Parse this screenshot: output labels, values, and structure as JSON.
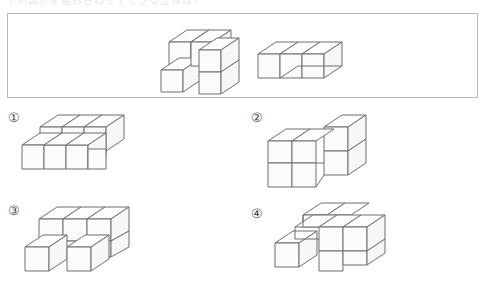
{
  "page": {
    "header_text_fragment": "下列図形を組み合わせてできる立体は？",
    "background_color": "#ffffff",
    "line_color": "#6f6f73",
    "box_border_color": "#b9b9bd"
  },
  "prompt": {
    "name": "prompt-box",
    "figures": [
      {
        "id": "prompt-figure-1",
        "description": "zig-zag cube assembly of 5 cubes",
        "cube_count": 5,
        "cubes": [
          {
            "x": 0,
            "y": 0,
            "z": 0
          },
          {
            "x": 1,
            "y": 0,
            "z": 0
          },
          {
            "x": 0,
            "y": 0,
            "z": 1
          },
          {
            "x": 1,
            "y": 1,
            "z": 0
          },
          {
            "x": 2,
            "y": 0,
            "z": 0
          }
        ]
      },
      {
        "id": "prompt-figure-2",
        "description": "row of 3 cubes with step",
        "cube_count": 3,
        "cubes": [
          {
            "x": 0,
            "y": 0,
            "z": 0
          },
          {
            "x": 1,
            "y": 0,
            "z": 0
          },
          {
            "x": 2,
            "y": 0,
            "z": 0
          }
        ]
      }
    ]
  },
  "options": [
    {
      "id": "option-1",
      "label": "①",
      "cube_count": 8,
      "description": "stepped block, two levels, upper-left row of three"
    },
    {
      "id": "option-2",
      "label": "②",
      "cube_count": 8,
      "description": "L-shaped two-level block with tall column at right"
    },
    {
      "id": "option-3",
      "label": "③",
      "cube_count": 9,
      "description": "three-wide upper slab with two lower cubes in front"
    },
    {
      "id": "option-4",
      "label": "④",
      "cube_count": 9,
      "description": "cross-like two-level assembly with front-left cube"
    }
  ]
}
